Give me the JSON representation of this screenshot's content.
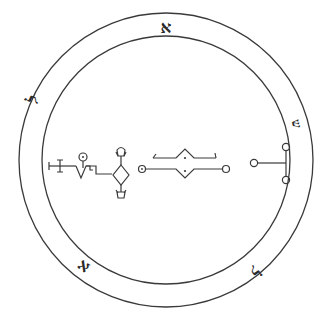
{
  "diagram": {
    "type": "magical-seal",
    "background": "#ffffff",
    "stroke_color": "#3a3a3a",
    "center": {
      "x": 166,
      "y": 160
    },
    "outer_radius": 147,
    "inner_radius": 124,
    "ring_letters": [
      {
        "char": "א",
        "name": "aleph",
        "x": 166,
        "y": 28,
        "rotate": 0
      },
      {
        "char": "ש",
        "name": "shin",
        "x": 296,
        "y": 124,
        "rotate": 75
      },
      {
        "char": "ל",
        "name": "lamed",
        "x": 254,
        "y": 270,
        "rotate": 145
      },
      {
        "char": "א",
        "name": "aleph",
        "x": 84,
        "y": 266,
        "rotate": 215
      },
      {
        "char": "ל",
        "name": "lamed",
        "x": 34,
        "y": 100,
        "rotate": 295
      }
    ],
    "sigils": [
      {
        "name": "sigil-left",
        "description": "Staff with crossbar, zigzag, circle and diamond with pendant loops"
      },
      {
        "name": "sigil-center",
        "description": "Double horizontal line with central peaked diamond and circle terminals"
      },
      {
        "name": "sigil-right",
        "description": "T-shaped line with three small circles"
      }
    ]
  }
}
